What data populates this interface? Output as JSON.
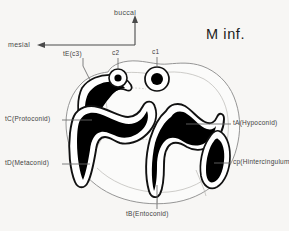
{
  "figure": {
    "title": "M inf.",
    "specimen_view": "occlusal-view-lower-molar",
    "background_color": "#f7f6f4",
    "enamel_fill_color": "#000000",
    "outline_color": "#1a1a1a",
    "leader_line_color": "#6b6b6b"
  },
  "orientation": {
    "up_label": "buccal",
    "left_label": "mesial"
  },
  "cusp_labels": {
    "tE": "tE(c3)",
    "c2": "c2",
    "c1": "c1",
    "tC": "tC(Protoconid)",
    "tD": "tD(Metaconid)",
    "tA": "tA(Hypoconid)",
    "cp": "cp(Hintercingulum)",
    "tB": "tB(Entoconid)"
  }
}
